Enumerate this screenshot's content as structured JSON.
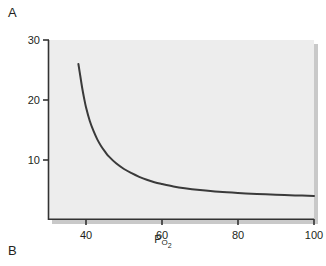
{
  "figure": {
    "panels": [
      {
        "letter": "A",
        "position": "top-left"
      },
      {
        "letter": "B",
        "position": "bottom-left"
      }
    ]
  },
  "chart_data": {
    "type": "line",
    "title": "",
    "subtitle": "",
    "xlabel": "P",
    "xlabel_subscript": "O2",
    "xlabel_full": "PO2",
    "ylabel": "Minute ventilation (L/min)",
    "xlim": [
      30,
      100
    ],
    "ylim": [
      0,
      30
    ],
    "xticks": [
      40,
      60,
      80,
      100
    ],
    "xtick_labels": [
      "40",
      "60",
      "80",
      "100"
    ],
    "yticks": [
      10,
      20,
      30
    ],
    "ytick_labels": [
      "10",
      "20",
      "30"
    ],
    "grid": false,
    "legend": null,
    "plot_background": "#ededed",
    "line_color": "#3a3a3a",
    "line_width": 2,
    "series": [
      {
        "name": "Minute ventilation vs PO2",
        "x": [
          38,
          38.5,
          39,
          39.5,
          40,
          41,
          42,
          43,
          44,
          45,
          46,
          48,
          50,
          52,
          54,
          56,
          58,
          60,
          63,
          66,
          70,
          75,
          80,
          85,
          90,
          95,
          100
        ],
        "values": [
          26.0,
          24.0,
          22.0,
          20.3,
          18.8,
          16.5,
          14.8,
          13.4,
          12.3,
          11.4,
          10.6,
          9.4,
          8.5,
          7.8,
          7.2,
          6.7,
          6.3,
          6.0,
          5.6,
          5.3,
          5.0,
          4.7,
          4.5,
          4.35,
          4.2,
          4.1,
          4.0
        ]
      }
    ]
  }
}
